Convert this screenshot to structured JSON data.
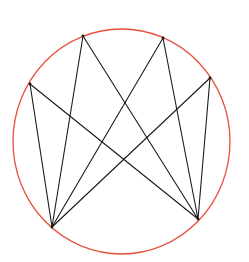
{
  "diagram": {
    "width": 249,
    "height": 262,
    "background": "#ffffff",
    "circle": {
      "cx": 121.5,
      "cy": 141.5,
      "rx": 108.5,
      "ry": 112.5,
      "stroke": "#e8503a",
      "stroke_width": 1.3
    },
    "line_color": "#1a1a1a",
    "line_width": 1.1,
    "points": [
      {
        "id": "A",
        "x": 30,
        "y": 84
      },
      {
        "id": "B",
        "x": 83,
        "y": 36
      },
      {
        "id": "C",
        "x": 163,
        "y": 38
      },
      {
        "id": "D",
        "x": 210,
        "y": 78
      },
      {
        "id": "E",
        "x": 52,
        "y": 227
      },
      {
        "id": "F",
        "x": 198,
        "y": 219
      }
    ],
    "edges": [
      [
        "E",
        "A"
      ],
      [
        "E",
        "B"
      ],
      [
        "E",
        "C"
      ],
      [
        "E",
        "D"
      ],
      [
        "F",
        "A"
      ],
      [
        "F",
        "B"
      ],
      [
        "F",
        "C"
      ],
      [
        "F",
        "D"
      ]
    ]
  }
}
